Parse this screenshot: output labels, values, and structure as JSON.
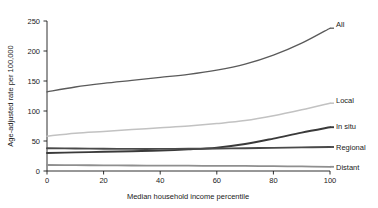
{
  "chart_data": {
    "type": "line",
    "title": "",
    "xlabel": "Median household income percentile",
    "ylabel": "Age-adjusted rate per 100,000",
    "xlim": [
      0,
      100
    ],
    "ylim": [
      0,
      250
    ],
    "xticks": [
      "0",
      "20",
      "40",
      "60",
      "80",
      "100"
    ],
    "xtick_values": [
      0,
      20,
      40,
      60,
      80,
      100
    ],
    "yticks": [
      "0",
      "50",
      "100",
      "150",
      "200",
      "250"
    ],
    "ytick_values": [
      0,
      50,
      100,
      150,
      200,
      250
    ],
    "grid": false,
    "legend_position": "right-inline-labels",
    "x": [
      0,
      10,
      20,
      30,
      40,
      50,
      60,
      70,
      80,
      90,
      100
    ],
    "series": [
      {
        "name": "All",
        "label": "All",
        "color": "#5a5a5a",
        "width": 1.3,
        "values": [
          132,
          140,
          146,
          151,
          156,
          161,
          168,
          178,
          193,
          213,
          238
        ]
      },
      {
        "name": "Local",
        "label": "Local",
        "color": "#c2c2c2",
        "width": 1.5,
        "values": [
          58,
          63,
          66,
          69,
          72,
          75,
          79,
          84,
          92,
          102,
          113
        ]
      },
      {
        "name": "In situ",
        "label": "In situ",
        "color": "#3a3a3a",
        "width": 1.9,
        "values": [
          30,
          31,
          32,
          33,
          34,
          36,
          39,
          45,
          54,
          64,
          73
        ]
      },
      {
        "name": "Regional",
        "label": "Regional",
        "color": "#4a4a4a",
        "width": 1.9,
        "values": [
          38,
          37.5,
          37,
          36.8,
          36.8,
          37,
          37.4,
          38,
          38.6,
          39.3,
          40
        ]
      },
      {
        "name": "Distant",
        "label": "Distant",
        "color": "#8f8f8f",
        "width": 1.8,
        "values": [
          10,
          9.7,
          9.4,
          9.2,
          9,
          8.8,
          8.6,
          8.4,
          8.1,
          7.6,
          7
        ]
      }
    ]
  },
  "labels": {
    "all": "All",
    "local": "Local",
    "in_situ": "In situ",
    "regional": "Regional",
    "distant": "Distant"
  },
  "axes": {
    "x_title": "Median household income percentile",
    "y_title": "Age-adjusted rate per 100,000",
    "x_tick_0": "0",
    "x_tick_1": "20",
    "x_tick_2": "40",
    "x_tick_3": "60",
    "x_tick_4": "80",
    "x_tick_5": "100",
    "y_tick_0": "0",
    "y_tick_1": "50",
    "y_tick_2": "100",
    "y_tick_3": "150",
    "y_tick_4": "200",
    "y_tick_5": "250"
  },
  "colors": {
    "background": "#ffffff",
    "axis": "#1a1a1a",
    "text": "#1a1a1a"
  }
}
